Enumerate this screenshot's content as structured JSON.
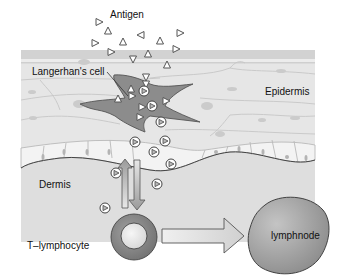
{
  "diagram": {
    "type": "biology-illustration",
    "labels": {
      "antigen": "Antigen",
      "langerhans_cell": "Langerhan's cell",
      "epidermis": "Epidermis",
      "dermis": "Dermis",
      "t_lymphocyte": "T–lymphocyte",
      "lymphnode": "lymphnode"
    },
    "regions": [
      {
        "name": "epidermis",
        "color": "#e6e6e6"
      },
      {
        "name": "stratum-corneum",
        "color": "#d6d6d6"
      },
      {
        "name": "basal-layer",
        "color": "#f2f2f2"
      },
      {
        "name": "dermis",
        "color": "#dddddd"
      }
    ],
    "colors": {
      "langerhans_cell": "#8c8c8c",
      "t_lymphocyte_outer": "#8a8a8a",
      "t_lymphocyte_inner": "#e8e8e8",
      "lymphnode": "#9a9a9a",
      "antigen": "#777777",
      "cell_outline": "#bdbdbd"
    },
    "flows": [
      {
        "from": "dermis",
        "to": "epidermis",
        "direction": "up"
      },
      {
        "from": "epidermis",
        "to": "t_lymphocyte",
        "direction": "down"
      },
      {
        "from": "t_lymphocyte",
        "to": "lymphnode",
        "direction": "right"
      }
    ]
  }
}
